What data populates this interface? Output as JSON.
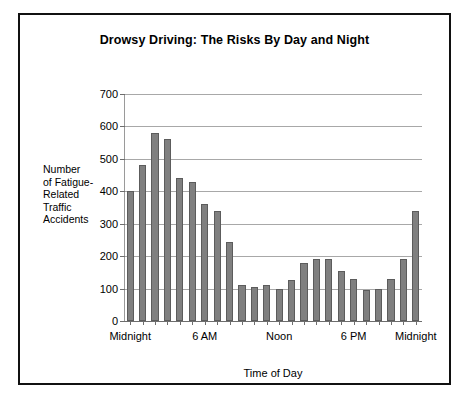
{
  "chart_data": {
    "type": "bar",
    "title": "Drowsy Driving: The Risks By Day and Night",
    "xlabel": "Time of Day",
    "ylabel": "Number of Fatigue-Related Traffic Accidents",
    "ylabel_lines": [
      "Number",
      "of Fatigue-",
      "Related",
      "Traffic",
      "Accidents"
    ],
    "ylim": [
      0,
      700
    ],
    "ytick_values": [
      0,
      100,
      200,
      300,
      400,
      500,
      600,
      700
    ],
    "ytick_labels": [
      "0",
      "100",
      "200",
      "300",
      "400",
      "500",
      "600",
      "700"
    ],
    "grid": true,
    "legend": "none",
    "bar_color": "#808080",
    "bar_edge_color": "#5c5c5c",
    "categories": [
      "0",
      "1",
      "2",
      "3",
      "4",
      "5",
      "6",
      "7",
      "8",
      "9",
      "10",
      "11",
      "12",
      "13",
      "14",
      "15",
      "16",
      "17",
      "18",
      "19",
      "20",
      "21",
      "22",
      "23"
    ],
    "values": [
      400,
      480,
      580,
      560,
      440,
      430,
      360,
      340,
      245,
      110,
      105,
      110,
      100,
      125,
      180,
      190,
      190,
      155,
      130,
      95,
      100,
      130,
      190,
      340
    ],
    "xtick_labels": [
      {
        "label": "Midnight",
        "index": 0
      },
      {
        "label": "6 AM",
        "index": 6
      },
      {
        "label": "Noon",
        "index": 12
      },
      {
        "label": "6 PM",
        "index": 18
      },
      {
        "label": "Midnight",
        "index": 23
      }
    ]
  }
}
